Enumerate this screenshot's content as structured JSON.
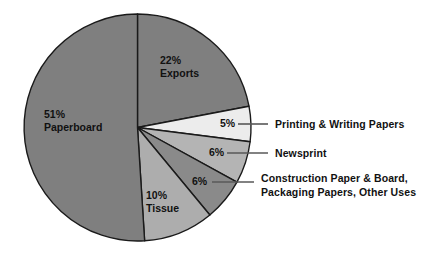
{
  "chart_data": {
    "type": "pie",
    "title": "",
    "subtitle": "",
    "xlabel": "",
    "ylabel": "",
    "legend_position": "callouts-right",
    "grid": false,
    "unit": "%",
    "total": 100,
    "start_angle_deg": 0,
    "direction": "clockwise",
    "categories": [
      "Exports",
      "Printing & Writing Papers",
      "Newsprint",
      "Construction Paper & Board, Packaging Papers, Other Uses",
      "Tissue",
      "Paperboard"
    ],
    "values": [
      22,
      5,
      6,
      6,
      10,
      51
    ],
    "slices": [
      {
        "name": "Exports",
        "value": 22,
        "percent_label": "22%",
        "name_label": "Exports",
        "label_mode": "inside",
        "color": "#7f7f7f",
        "start_deg": 0,
        "end_deg": 79.2,
        "label_x": 160,
        "label_y": 64
      },
      {
        "name": "Printing & Writing Papers",
        "value": 5,
        "percent_label": "5%",
        "name_label": "Printing & Writing Papers",
        "label_mode": "callout",
        "color": "#ececec",
        "start_deg": 79.2,
        "end_deg": 97.2,
        "pct_x": 220,
        "pct_y": 127,
        "leader_x1": 238,
        "leader_y1": 124,
        "leader_x2": 268,
        "leader_y2": 124,
        "text_x": 275,
        "text_y": 128,
        "text_lines": [
          "Printing & Writing Papers"
        ]
      },
      {
        "name": "Newsprint",
        "value": 6,
        "percent_label": "6%",
        "name_label": "Newsprint",
        "label_mode": "callout",
        "color": "#b4b4b4",
        "start_deg": 97.2,
        "end_deg": 118.8,
        "pct_x": 209,
        "pct_y": 156,
        "leader_x1": 227,
        "leader_y1": 153,
        "leader_x2": 268,
        "leader_y2": 153,
        "text_x": 275,
        "text_y": 157,
        "text_lines": [
          "Newsprint"
        ]
      },
      {
        "name": "Construction Paper & Board, Packaging Papers, Other Uses",
        "value": 6,
        "percent_label": "6%",
        "name_label": "Construction Paper & Board, Packaging Papers, Other Uses",
        "label_mode": "callout",
        "color": "#8a8a8a",
        "start_deg": 118.8,
        "end_deg": 140.4,
        "pct_x": 192,
        "pct_y": 185,
        "leader_x1": 212,
        "leader_y1": 182,
        "leader_x2": 254,
        "leader_y2": 182,
        "text_x": 261,
        "text_y": 182,
        "text_lines": [
          "Construction Paper & Board,",
          "Packaging Papers, Other Uses"
        ]
      },
      {
        "name": "Tissue",
        "value": 10,
        "percent_label": "10%",
        "name_label": "Tissue",
        "label_mode": "inside",
        "color": "#adadad",
        "start_deg": 140.4,
        "end_deg": 176.4,
        "label_x": 146,
        "label_y": 199
      },
      {
        "name": "Paperboard",
        "value": 51,
        "percent_label": "51%",
        "name_label": "Paperboard",
        "label_mode": "inside",
        "color": "#7f7f7f",
        "start_deg": 176.4,
        "end_deg": 360,
        "label_x": 44,
        "label_y": 118
      }
    ],
    "geometry": {
      "center_x": 137.5,
      "center_y": 127.5,
      "radius": 113.5
    },
    "colors": {
      "background": "#ffffff",
      "outline": "#1a1a1a",
      "leader": "#585858",
      "text": "#111111"
    }
  }
}
